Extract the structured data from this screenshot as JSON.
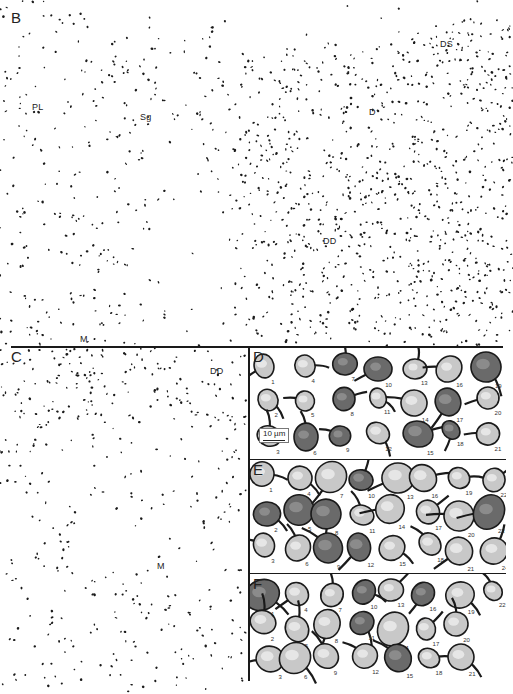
{
  "figure": {
    "panels": [
      {
        "id": "B",
        "label": "B",
        "description": "Low-magnification dot map of Nissl-stained cell bodies",
        "region_labels": [
          {
            "text": "PL",
            "x": 29,
            "y": 103
          },
          {
            "text": "Sg",
            "x": 139,
            "y": 113
          },
          {
            "text": "DS",
            "x": 438,
            "y": 11
          },
          {
            "text": "D",
            "x": 369,
            "y": 108
          },
          {
            "text": "DD",
            "x": 324,
            "y": 236
          },
          {
            "text": "M",
            "x": 78,
            "y": 335
          }
        ]
      },
      {
        "id": "C",
        "label": "C",
        "description": "Dot map of cell bodies, deeper section",
        "region_labels": [
          {
            "text": "DD",
            "x": 210,
            "y": 367
          },
          {
            "text": "M",
            "x": 156,
            "y": 562
          }
        ]
      },
      {
        "id": "D",
        "label": "D",
        "description": "Camera lucida drawings of neurons",
        "scale_bar": "10 µm",
        "cell_numbers": [
          "1",
          "2",
          "3",
          "4",
          "5",
          "6",
          "7",
          "8",
          "9",
          "10",
          "11",
          "12",
          "13",
          "14",
          "15",
          "16",
          "17",
          "18",
          "19",
          "20",
          "21"
        ]
      },
      {
        "id": "E",
        "label": "E",
        "description": "Camera lucida drawings of neurons",
        "cell_numbers": [
          "1",
          "2",
          "3",
          "4",
          "5",
          "6",
          "7",
          "8",
          "9",
          "10",
          "11",
          "12",
          "13",
          "14",
          "15",
          "16",
          "17",
          "18",
          "19",
          "20",
          "21",
          "22",
          "23",
          "24"
        ]
      },
      {
        "id": "F",
        "label": "F",
        "description": "Camera lucida drawings of neurons",
        "cell_numbers": [
          "1",
          "2",
          "3",
          "4",
          "5",
          "6",
          "7",
          "8",
          "9",
          "10",
          "11",
          "12",
          "13",
          "14",
          "15",
          "16",
          "17",
          "18",
          "19",
          "20",
          "21",
          "22"
        ]
      }
    ],
    "colors": {
      "ink": "#1a1a1a",
      "background": "#ffffff",
      "cell_fill": "#c8c8c8",
      "cell_dark": "#6a6a6a"
    }
  }
}
